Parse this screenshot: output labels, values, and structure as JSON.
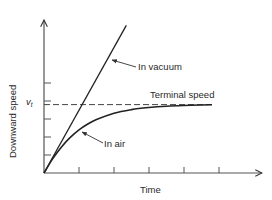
{
  "chart_data": {
    "type": "line",
    "title": "",
    "xlabel": "Time",
    "ylabel": "Downward speed",
    "xlim": [
      0,
      6.2
    ],
    "ylim": [
      0,
      8.5
    ],
    "x_ticks": [
      1,
      2,
      3,
      4,
      5
    ],
    "y_ticks": [
      1,
      2,
      3,
      4,
      5
    ],
    "x_tick_labels": [
      "",
      "",
      "",
      "",
      ""
    ],
    "y_tick_labels": [
      "",
      "",
      "",
      "",
      ""
    ],
    "grid": false,
    "terminal_speed": 3.8,
    "terminal_speed_tick_label": "v",
    "terminal_speed_tick_subscript": "t",
    "series": [
      {
        "name": "In vacuum",
        "style": "solid",
        "x": [
          0,
          2.35
        ],
        "y": [
          0,
          8.2
        ]
      },
      {
        "name": "In air",
        "style": "solid",
        "x": [
          0,
          0.25,
          0.5,
          0.75,
          1.0,
          1.25,
          1.5,
          2.0,
          2.5,
          3.0,
          3.5,
          4.0,
          4.5,
          4.8
        ],
        "y": [
          0,
          0.8,
          1.45,
          1.98,
          2.4,
          2.72,
          2.97,
          3.32,
          3.52,
          3.64,
          3.71,
          3.75,
          3.78,
          3.79
        ]
      },
      {
        "name": "Terminal speed",
        "style": "dashed",
        "x": [
          0,
          4.8
        ],
        "y": [
          3.8,
          3.8
        ]
      }
    ],
    "annotations": [
      {
        "text": "In vacuum",
        "points_to": "In vacuum"
      },
      {
        "text": "Terminal speed",
        "points_to": "Terminal speed"
      },
      {
        "text": "In air",
        "points_to": "In air"
      }
    ]
  }
}
